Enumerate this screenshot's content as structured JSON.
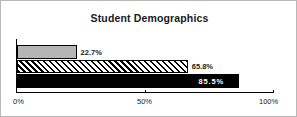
{
  "chart_data": {
    "type": "bar",
    "orientation": "horizontal",
    "title": "Student Demographics",
    "xlabel": "",
    "ylabel": "",
    "xlim": [
      0,
      100
    ],
    "grid": false,
    "legend": "none",
    "tick_labels": [
      "0%",
      "50%",
      "100%"
    ],
    "tick_values": [
      0,
      50,
      100
    ],
    "categories": [
      "Series 1",
      "Series 2",
      "Series 3"
    ],
    "values": [
      22.7,
      65.8,
      85.5
    ],
    "data_labels": [
      "22.7%",
      "65.8%",
      "85.5%"
    ],
    "bar_styles": [
      "solid-gray",
      "diagonal-hatch",
      "solid-black"
    ],
    "colors": {
      "bar_1_fill": "#b5b5b5",
      "bar_2_fill": "#ffffff",
      "bar_2_hatch": "#000000",
      "bar_3_fill": "#000000",
      "bar_outline": "#000000",
      "axis": "#000000",
      "text": "#1a1a1a",
      "label_inside": "#ffffff",
      "frame": "#b8b8b8"
    }
  },
  "axis": {
    "ticks": [
      {
        "label": "0%",
        "value": 0
      },
      {
        "label": "50%",
        "value": 50
      },
      {
        "label": "100%",
        "value": 100
      }
    ]
  },
  "bars": [
    {
      "label": "22.7%",
      "value": 22.7
    },
    {
      "label": "65.8%",
      "value": 65.8
    },
    {
      "label": "85.5%",
      "value": 85.5
    }
  ]
}
